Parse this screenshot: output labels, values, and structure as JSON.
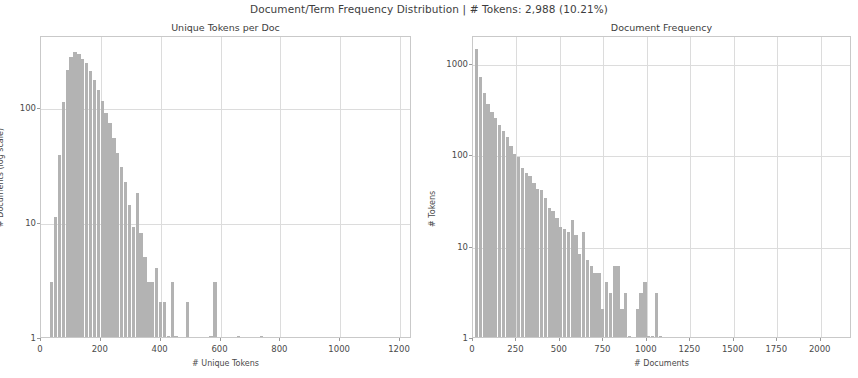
{
  "figure": {
    "suptitle": "Document/Term Frequency Distribution | # Tokens: 2,988 (10.21%)",
    "background_color": "#ffffff",
    "bar_color": "#b3b3b3",
    "grid_color": "#dcdcdc",
    "frame_color": "#c9c9c9"
  },
  "chart_data": [
    {
      "type": "bar",
      "title": "Unique Tokens per Doc",
      "xlabel": "# Unique Tokens",
      "ylabel": "# Documents (log scale)",
      "yscale": "log",
      "xlim": [
        0,
        1240
      ],
      "ylim": [
        1,
        420
      ],
      "grid": true,
      "legend": "none",
      "xticks": [
        0,
        200,
        400,
        600,
        800,
        1000,
        1200
      ],
      "xticklabels": [
        "0",
        "200",
        "400",
        "600",
        "800",
        "1000",
        "1200"
      ],
      "yticks": [
        1,
        10,
        100
      ],
      "yticklabels": [
        "1",
        "10",
        "100"
      ],
      "bin_width": 13,
      "bins": [
        {
          "x": 30,
          "v": 3
        },
        {
          "x": 43,
          "v": 11
        },
        {
          "x": 56,
          "v": 38
        },
        {
          "x": 69,
          "v": 110
        },
        {
          "x": 82,
          "v": 210
        },
        {
          "x": 95,
          "v": 268
        },
        {
          "x": 108,
          "v": 300
        },
        {
          "x": 121,
          "v": 285
        },
        {
          "x": 134,
          "v": 262
        },
        {
          "x": 147,
          "v": 238
        },
        {
          "x": 160,
          "v": 205
        },
        {
          "x": 173,
          "v": 172
        },
        {
          "x": 186,
          "v": 140
        },
        {
          "x": 199,
          "v": 112
        },
        {
          "x": 212,
          "v": 88
        },
        {
          "x": 225,
          "v": 72
        },
        {
          "x": 238,
          "v": 54
        },
        {
          "x": 251,
          "v": 40
        },
        {
          "x": 264,
          "v": 30
        },
        {
          "x": 277,
          "v": 22
        },
        {
          "x": 290,
          "v": 14
        },
        {
          "x": 303,
          "v": 9
        },
        {
          "x": 316,
          "v": 18
        },
        {
          "x": 329,
          "v": 8
        },
        {
          "x": 342,
          "v": 5
        },
        {
          "x": 355,
          "v": 3
        },
        {
          "x": 368,
          "v": 3
        },
        {
          "x": 381,
          "v": 4
        },
        {
          "x": 394,
          "v": 2
        },
        {
          "x": 407,
          "v": 2
        },
        {
          "x": 420,
          "v": 1
        },
        {
          "x": 433,
          "v": 3
        },
        {
          "x": 446,
          "v": 1
        },
        {
          "x": 485,
          "v": 2
        },
        {
          "x": 563,
          "v": 1
        },
        {
          "x": 576,
          "v": 3
        },
        {
          "x": 654,
          "v": 1
        },
        {
          "x": 732,
          "v": 1
        }
      ]
    },
    {
      "type": "bar",
      "title": "Document Frequency",
      "xlabel": "# Documents",
      "ylabel": "# Tokens",
      "yscale": "log",
      "xlim": [
        0,
        2180
      ],
      "ylim": [
        1,
        2000
      ],
      "grid": true,
      "legend": "none",
      "xticks": [
        0,
        250,
        500,
        750,
        1000,
        1250,
        1500,
        1750,
        2000
      ],
      "xticklabels": [
        "0",
        "250",
        "500",
        "750",
        "1000",
        "1250",
        "1500",
        "1750",
        "2000"
      ],
      "yticks": [
        1,
        10,
        100,
        1000
      ],
      "yticklabels": [
        "1",
        "10",
        "100",
        "1000"
      ],
      "bin_width": 22,
      "bins": [
        {
          "x": 11,
          "v": 1400
        },
        {
          "x": 33,
          "v": 700
        },
        {
          "x": 55,
          "v": 470
        },
        {
          "x": 77,
          "v": 350
        },
        {
          "x": 99,
          "v": 285
        },
        {
          "x": 121,
          "v": 250
        },
        {
          "x": 143,
          "v": 210
        },
        {
          "x": 165,
          "v": 180
        },
        {
          "x": 187,
          "v": 155
        },
        {
          "x": 209,
          "v": 122
        },
        {
          "x": 231,
          "v": 100
        },
        {
          "x": 253,
          "v": 92
        },
        {
          "x": 275,
          "v": 70
        },
        {
          "x": 297,
          "v": 62
        },
        {
          "x": 319,
          "v": 58
        },
        {
          "x": 341,
          "v": 48
        },
        {
          "x": 363,
          "v": 42
        },
        {
          "x": 385,
          "v": 40
        },
        {
          "x": 407,
          "v": 33
        },
        {
          "x": 429,
          "v": 26
        },
        {
          "x": 451,
          "v": 24
        },
        {
          "x": 473,
          "v": 20
        },
        {
          "x": 495,
          "v": 16
        },
        {
          "x": 517,
          "v": 15
        },
        {
          "x": 539,
          "v": 14
        },
        {
          "x": 561,
          "v": 19
        },
        {
          "x": 583,
          "v": 13
        },
        {
          "x": 605,
          "v": 8
        },
        {
          "x": 627,
          "v": 14
        },
        {
          "x": 649,
          "v": 7
        },
        {
          "x": 671,
          "v": 6
        },
        {
          "x": 693,
          "v": 5
        },
        {
          "x": 715,
          "v": 5
        },
        {
          "x": 737,
          "v": 2
        },
        {
          "x": 759,
          "v": 4
        },
        {
          "x": 781,
          "v": 3
        },
        {
          "x": 803,
          "v": 6
        },
        {
          "x": 825,
          "v": 6
        },
        {
          "x": 847,
          "v": 2
        },
        {
          "x": 869,
          "v": 3
        },
        {
          "x": 891,
          "v": 1
        },
        {
          "x": 935,
          "v": 2
        },
        {
          "x": 957,
          "v": 3
        },
        {
          "x": 979,
          "v": 4
        },
        {
          "x": 1001,
          "v": 1
        },
        {
          "x": 1023,
          "v": 1
        },
        {
          "x": 1045,
          "v": 3
        },
        {
          "x": 1067,
          "v": 1
        }
      ]
    }
  ]
}
